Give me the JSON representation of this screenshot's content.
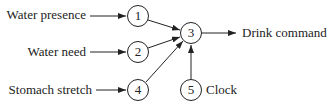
{
  "diagram": {
    "type": "neural-network",
    "nodes": [
      {
        "id": "1",
        "label": "1",
        "cx": 138,
        "cy": 16
      },
      {
        "id": "2",
        "label": "2",
        "cx": 138,
        "cy": 52
      },
      {
        "id": "3",
        "label": "3",
        "cx": 191,
        "cy": 33
      },
      {
        "id": "4",
        "label": "4",
        "cx": 138,
        "cy": 90
      },
      {
        "id": "5",
        "label": "5",
        "cx": 191,
        "cy": 90
      }
    ],
    "inputs": [
      {
        "label": "Water presence",
        "to": "1"
      },
      {
        "label": "Water need",
        "to": "2"
      },
      {
        "label": "Stomach stretch",
        "to": "4"
      }
    ],
    "output": {
      "label": "Drink command",
      "from": "3"
    },
    "clock": {
      "label": "Clock",
      "node": "5"
    },
    "edges": [
      {
        "from": "1",
        "to": "3"
      },
      {
        "from": "2",
        "to": "3"
      },
      {
        "from": "4",
        "to": "3"
      },
      {
        "from": "5",
        "to": "3"
      }
    ]
  }
}
